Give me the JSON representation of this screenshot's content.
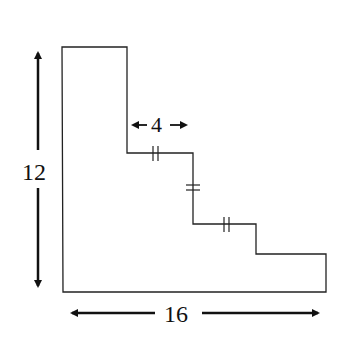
{
  "diagram": {
    "type": "staircase-polygon",
    "labels": {
      "height": "12",
      "width": "16",
      "step": "4"
    },
    "outline_points": [
      [
        62,
        47
      ],
      [
        127,
        47
      ],
      [
        127,
        153
      ],
      [
        193,
        153
      ],
      [
        193,
        224
      ],
      [
        256,
        224
      ],
      [
        256,
        254
      ],
      [
        326,
        254
      ],
      [
        326,
        292
      ],
      [
        63,
        292
      ]
    ],
    "congruent_marks": [
      "step-1-horizontal",
      "step-1-vertical",
      "step-2-horizontal"
    ],
    "colors": {
      "stroke": "#222222",
      "background": "#ffffff"
    }
  }
}
